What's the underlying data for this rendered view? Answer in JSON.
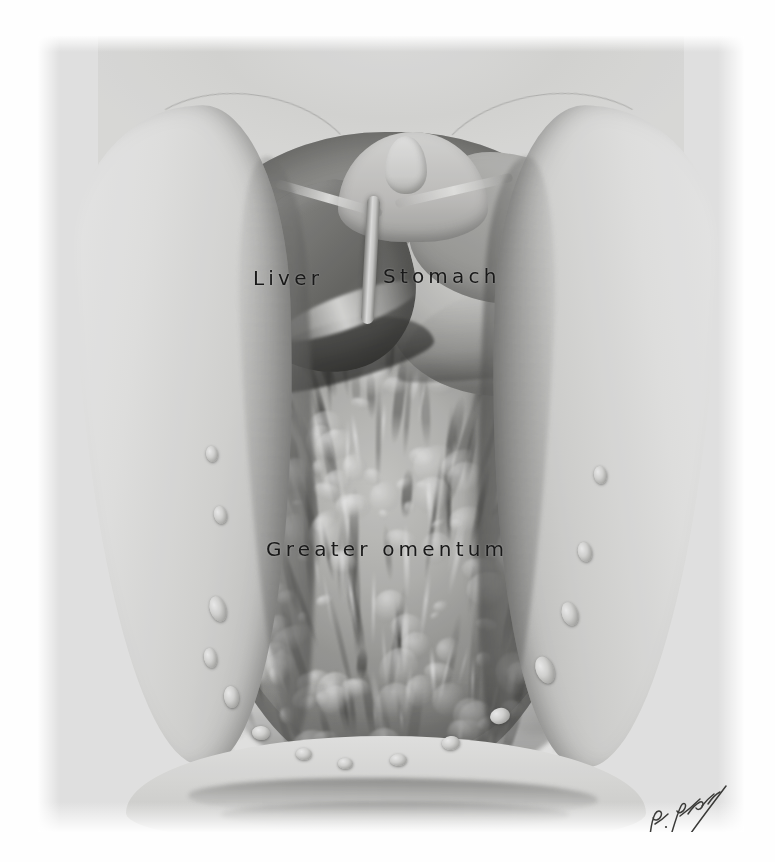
{
  "plate": {
    "kind": "anatomical-illustration",
    "subject": "Opened abdominal cavity showing liver, stomach and greater omentum",
    "medium": "halftone printed plate, grayscale",
    "background_color": "#fefefe",
    "plate_color": "#f2f2f1",
    "ink_color": "#191919"
  },
  "labels": {
    "liver": "Liver",
    "stomach": "Stomach",
    "greater_omentum": "Greater omentum"
  },
  "signature": {
    "artist": "R. Drake",
    "style": "handwritten cursive"
  },
  "structures": [
    {
      "name": "abdominal-wall-flap-left",
      "description": "retracted skin and muscle flap on the left"
    },
    {
      "name": "abdominal-wall-flap-right",
      "description": "retracted skin and muscle flap on the right"
    },
    {
      "name": "liver",
      "description": "left lobe of liver, cut inferior border"
    },
    {
      "name": "falciform-ligament",
      "description": "falciform ligament with ligamentum teres"
    },
    {
      "name": "stomach",
      "description": "anterior surface and greater curvature of stomach"
    },
    {
      "name": "greater-omentum",
      "description": "fatty apron draping over the intestines"
    },
    {
      "name": "lower-abdominal-wall",
      "description": "suprapubic region below the omentum"
    }
  ]
}
